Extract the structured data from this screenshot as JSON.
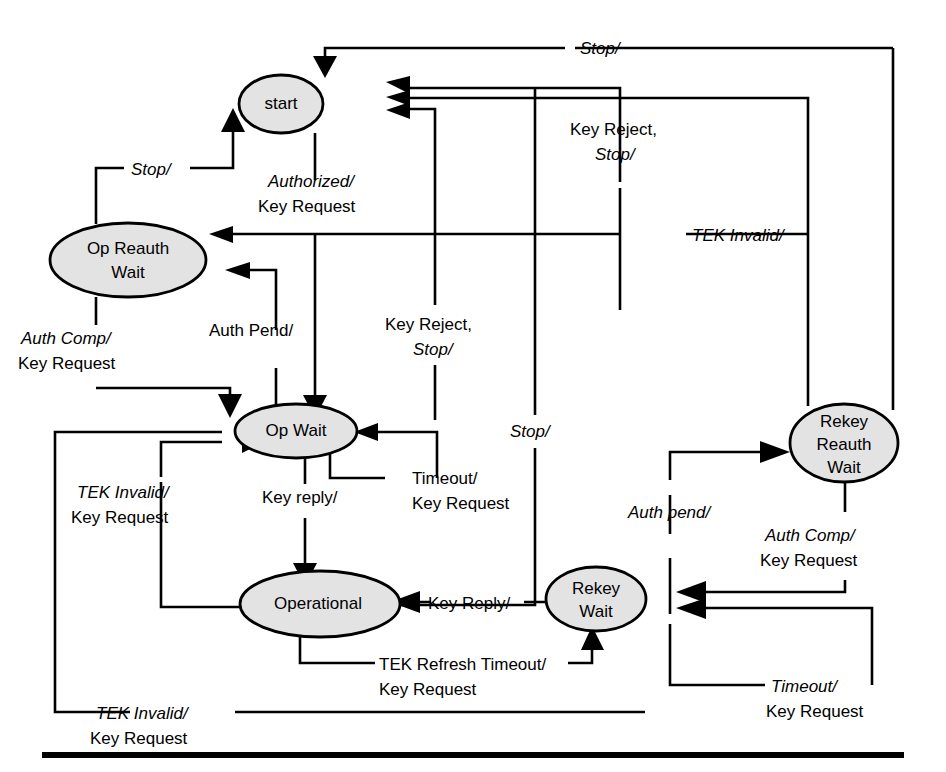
{
  "diagram": {
    "colors": {
      "state_fill": "#e3e3e3",
      "stroke": "#000000",
      "background": "#ffffff"
    },
    "states": [
      {
        "id": "start",
        "label": "start",
        "lines": [
          "start"
        ],
        "cx": 281,
        "cy": 104,
        "rx": 42,
        "ry": 29
      },
      {
        "id": "op_reauth_wait",
        "label": "Op Reauth Wait",
        "lines": [
          "Op Reauth",
          "Wait"
        ],
        "cx": 128,
        "cy": 260,
        "rx": 78,
        "ry": 37
      },
      {
        "id": "op_wait",
        "label": "Op Wait",
        "lines": [
          "Op Wait"
        ],
        "cx": 296,
        "cy": 431,
        "rx": 61,
        "ry": 27
      },
      {
        "id": "operational",
        "label": "Operational",
        "lines": [
          "Operational"
        ],
        "cx": 320,
        "cy": 604,
        "rx": 80,
        "ry": 33
      },
      {
        "id": "rekey_wait",
        "label": "Rekey Wait",
        "lines": [
          "Rekey",
          "Wait"
        ],
        "cx": 596,
        "cy": 599,
        "rx": 50,
        "ry": 32
      },
      {
        "id": "rekey_reauth_wait",
        "label": "Rekey Reauth Wait",
        "lines": [
          "Rekey",
          "Reauth",
          "Wait"
        ],
        "cx": 844,
        "cy": 443,
        "rx": 54,
        "ry": 39
      }
    ],
    "transitions": [
      {
        "id": "t-stop-top",
        "from": "rekey_reauth_wait",
        "to": "start",
        "event": "Stop/",
        "action": "",
        "label_lines": [
          {
            "text": "Stop/",
            "italic": true
          }
        ]
      },
      {
        "id": "t-authorized",
        "from": "start",
        "to": "op_wait",
        "event": "Authorized/",
        "action": "Key Request",
        "label_lines": [
          {
            "text": "Authorized/",
            "italic": true
          },
          {
            "text": "Key Request",
            "italic": false
          }
        ]
      },
      {
        "id": "t-stop-opreauth",
        "from": "op_reauth_wait",
        "to": "start",
        "event": "Stop/",
        "action": "",
        "label_lines": [
          {
            "text": "Stop/",
            "italic": true
          }
        ]
      },
      {
        "id": "t-key-reject-stop-1",
        "from": "op_wait",
        "to": "start",
        "event": "Key Reject, Stop/",
        "action": "",
        "label_lines": [
          {
            "text": "Key Reject,",
            "italic": false
          },
          {
            "text": "Stop/",
            "italic": true
          }
        ]
      },
      {
        "id": "t-key-reject-stop-2",
        "from": "op_wait",
        "to": "start",
        "event": "Key Reject, Stop/",
        "action": "",
        "label_lines": [
          {
            "text": "Key Reject,",
            "italic": false
          },
          {
            "text": "Stop/",
            "italic": true
          }
        ]
      },
      {
        "id": "t-tek-invalid-reauth",
        "from": "rekey_reauth_wait",
        "to": "op_reauth_wait",
        "event": "TEK Invalid/",
        "action": "",
        "label_lines": [
          {
            "text": "TEK Invalid/",
            "italic": true
          }
        ]
      },
      {
        "id": "t-auth-pend-opwait",
        "from": "op_wait",
        "to": "op_reauth_wait",
        "event": "Auth Pend/",
        "action": "",
        "label_lines": [
          {
            "text": "Auth Pend/",
            "italic": false
          }
        ]
      },
      {
        "id": "t-auth-comp-opreauth",
        "from": "op_reauth_wait",
        "to": "op_wait",
        "event": "Auth Comp/",
        "action": "Key Request",
        "label_lines": [
          {
            "text": "Auth Comp/",
            "italic": true
          },
          {
            "text": "Key Request",
            "italic": false
          }
        ]
      },
      {
        "id": "t-timeout-opwait",
        "from": "op_wait",
        "to": "op_wait",
        "event": "Timeout/",
        "action": "Key Request",
        "label_lines": [
          {
            "text": "Timeout/",
            "italic": false
          },
          {
            "text": "Key Request",
            "italic": false
          }
        ]
      },
      {
        "id": "t-key-reply",
        "from": "op_wait",
        "to": "operational",
        "event": "Key reply/",
        "action": "",
        "label_lines": [
          {
            "text": "Key reply/",
            "italic": false
          }
        ]
      },
      {
        "id": "t-tek-invalid-op",
        "from": "operational",
        "to": "op_wait",
        "event": "TEK Invalid/",
        "action": "Key Request",
        "label_lines": [
          {
            "text": "TEK Invalid/",
            "italic": true
          },
          {
            "text": "Key Request",
            "italic": false
          }
        ]
      },
      {
        "id": "t-tek-invalid-bottom",
        "from": "rekey_wait",
        "to": "op_wait",
        "event": "TEK Invalid/",
        "action": "Key Request",
        "label_lines": [
          {
            "text": "TEK Invalid/",
            "italic": true
          },
          {
            "text": "Key Request",
            "italic": false
          }
        ]
      },
      {
        "id": "t-stop-operational",
        "from": "rekey_wait",
        "to": "start",
        "event": "Stop/",
        "action": "",
        "label_lines": [
          {
            "text": "Stop/",
            "italic": true
          }
        ]
      },
      {
        "id": "t-tek-refresh",
        "from": "operational",
        "to": "rekey_wait",
        "event": "TEK Refresh Timeout/",
        "action": "Key Request",
        "label_lines": [
          {
            "text": "TEK Refresh Timeout/",
            "italic": false
          },
          {
            "text": "Key Request",
            "italic": false
          }
        ]
      },
      {
        "id": "t-key-reply-rekey",
        "from": "rekey_wait",
        "to": "operational",
        "event": "Key Reply/",
        "action": "",
        "label_lines": [
          {
            "text": "Key Reply/",
            "italic": false
          }
        ]
      },
      {
        "id": "t-auth-pend-rekey",
        "from": "rekey_wait",
        "to": "rekey_reauth_wait",
        "event": "Auth pend/",
        "action": "",
        "label_lines": [
          {
            "text": "Auth pend/",
            "italic": true
          }
        ]
      },
      {
        "id": "t-auth-comp-rekey",
        "from": "rekey_reauth_wait",
        "to": "rekey_wait",
        "event": "Auth Comp/",
        "action": "Key Request",
        "label_lines": [
          {
            "text": "Auth Comp/",
            "italic": true
          },
          {
            "text": "Key Request",
            "italic": false
          }
        ]
      },
      {
        "id": "t-timeout-rekey",
        "from": "rekey_wait",
        "to": "rekey_wait",
        "event": "Timeout/",
        "action": "Key Request",
        "label_lines": [
          {
            "text": "Timeout/",
            "italic": true
          },
          {
            "text": "Key Request",
            "italic": false
          }
        ]
      }
    ],
    "labels": {
      "stop_top": "Stop/",
      "authorized_l1": "Authorized/",
      "authorized_l2": "Key Request",
      "stop_opreauth": "Stop/",
      "key_reject_a_l1": "Key Reject,",
      "key_reject_a_l2": "Stop/",
      "key_reject_b_l1": "Key Reject,",
      "key_reject_b_l2": "Stop/",
      "tek_invalid_right": "TEK Invalid/",
      "auth_pend_opwait": "Auth Pend/",
      "auth_comp_l1": "Auth Comp/",
      "auth_comp_l2": "Key Request",
      "tek_invalid_mid_l1": "TEK Invalid/",
      "tek_invalid_mid_l2": "Key Request",
      "key_reply_down": "Key reply/",
      "timeout_opwait_l1": "Timeout/",
      "timeout_opwait_l2": "Key Request",
      "stop_mid": "Stop/",
      "tek_refresh_l1": "TEK Refresh Timeout/",
      "tek_refresh_l2": "Key Request",
      "tek_invalid_bottom_l1": "TEK Invalid/",
      "tek_invalid_bottom_l2": "Key Request",
      "key_reply_rekey": "Key Reply/",
      "auth_pend_rekey": "Auth pend/",
      "auth_comp_rekey_l1": "Auth Comp/",
      "auth_comp_rekey_l2": "Key Request",
      "timeout_rekey_l1": "Timeout/",
      "timeout_rekey_l2": "Key Request"
    },
    "state_text": {
      "start": "start",
      "op_reauth_1": "Op Reauth",
      "op_reauth_2": "Wait",
      "op_wait": "Op Wait",
      "operational": "Operational",
      "rekey_wait_1": "Rekey",
      "rekey_wait_2": "Wait",
      "rekey_reauth_1": "Rekey",
      "rekey_reauth_2": "Reauth",
      "rekey_reauth_3": "Wait"
    }
  }
}
